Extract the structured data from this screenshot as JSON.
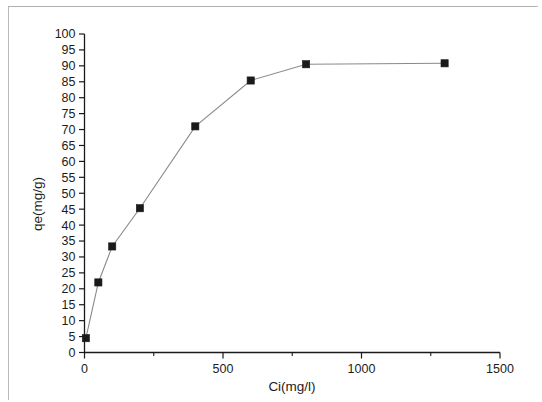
{
  "chart_data": {
    "type": "line",
    "title": "",
    "subtitle": "",
    "xlabel": "Ci(mg/l)",
    "ylabel": "qe(mg/g)",
    "xlim": [
      0,
      1500
    ],
    "ylim": [
      0,
      100
    ],
    "x_ticks": [
      0,
      500,
      1000,
      1500
    ],
    "x_tick_labels": [
      "0",
      "500",
      "1000",
      "1500"
    ],
    "x_minor_tick_step": 250,
    "y_ticks": [
      0,
      5,
      10,
      15,
      20,
      25,
      30,
      35,
      40,
      45,
      50,
      55,
      60,
      65,
      70,
      75,
      80,
      85,
      90,
      95,
      100
    ],
    "y_tick_labels": [
      "0",
      "5",
      "10",
      "15",
      "20",
      "25",
      "30",
      "35",
      "40",
      "45",
      "50",
      "55",
      "60",
      "65",
      "70",
      "75",
      "80",
      "85",
      "90",
      "95",
      "100"
    ],
    "grid": false,
    "legend": false,
    "legend_position": "none",
    "marker": "filled-square",
    "marker_color": "#1a1a1a",
    "line_color": "#8a8a8a",
    "axis_color": "#1a1a1a",
    "background_color": "#ffffff",
    "x": [
      5,
      50,
      100,
      200,
      400,
      600,
      800,
      1300
    ],
    "y": [
      4.5,
      22.0,
      33.3,
      45.3,
      71.0,
      85.4,
      90.5,
      90.8
    ],
    "series": [
      {
        "name": "qe vs Ci",
        "points": [
          {
            "x": 5,
            "y": 4.5
          },
          {
            "x": 50,
            "y": 22.0
          },
          {
            "x": 100,
            "y": 33.3
          },
          {
            "x": 200,
            "y": 45.3
          },
          {
            "x": 400,
            "y": 71.0
          },
          {
            "x": 600,
            "y": 85.4
          },
          {
            "x": 800,
            "y": 90.5
          },
          {
            "x": 1300,
            "y": 90.8
          }
        ]
      }
    ]
  }
}
